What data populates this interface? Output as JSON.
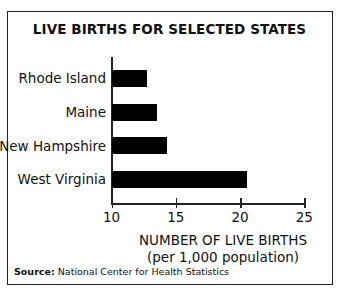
{
  "chart_data": {
    "type": "bar",
    "orientation": "horizontal",
    "title": "LIVE BIRTHS FOR SELECTED STATES",
    "categories": [
      "Rhode Island",
      "Maine",
      "New Hampshire",
      "West Virginia"
    ],
    "values": [
      12.7,
      13.5,
      14.3,
      20.5
    ],
    "xlabel": "NUMBER OF LIVE BIRTHS (per 1,000 population)",
    "xlabel_line1": "NUMBER OF LIVE BIRTHS",
    "xlabel_line2": "(per 1,000 population)",
    "ylabel": "",
    "xlim": [
      10,
      25
    ],
    "xticks": [
      "10",
      "15",
      "20",
      "25"
    ],
    "grid": false,
    "legend": null,
    "bar_color": "#000000",
    "source_label": "Source:",
    "source_text": "National Center for Health Statistics"
  }
}
